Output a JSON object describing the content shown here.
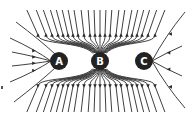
{
  "diagram": {
    "type": "electric-field-lines",
    "charges": [
      {
        "label": "A",
        "cx": 59,
        "cy": 61,
        "r": 9
      },
      {
        "label": "B",
        "cx": 100,
        "cy": 61,
        "r": 9
      },
      {
        "label": "C",
        "cx": 144,
        "cy": 61,
        "r": 9
      }
    ],
    "colors": {
      "line": "#2a2a2a",
      "charge_fill": "#222222",
      "label": "#ffffff",
      "background": "#ffffff"
    },
    "arrow_rows_y": [
      35,
      86
    ]
  }
}
